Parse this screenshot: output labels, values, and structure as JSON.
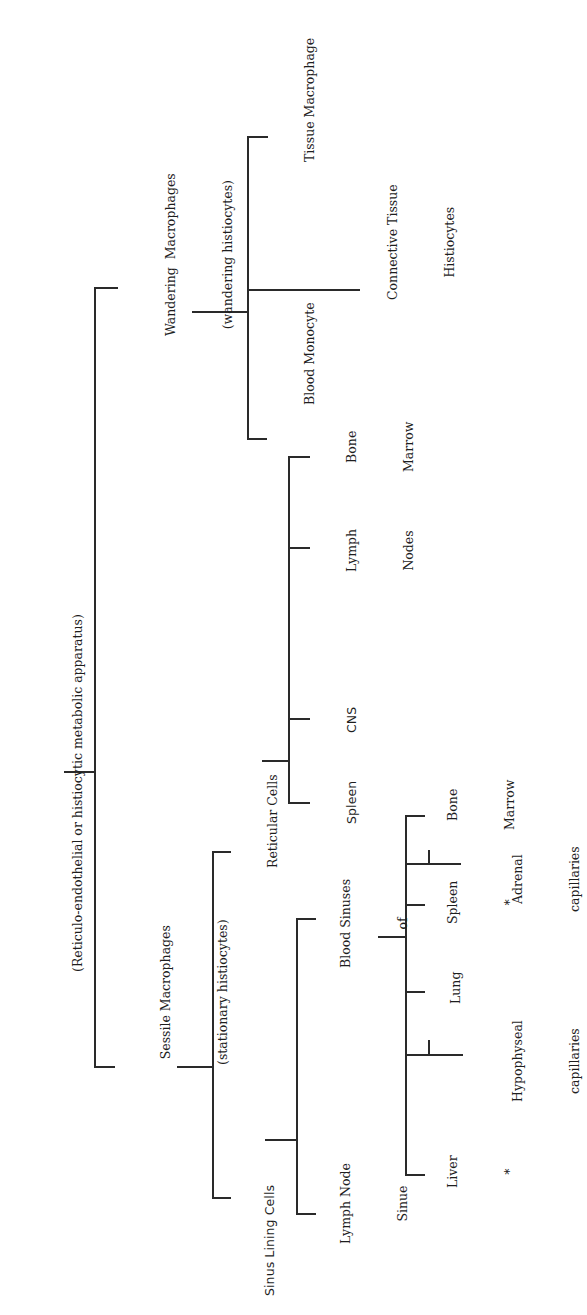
{
  "diagram": {
    "orientation": "rotated 90 degrees counter-clockwise",
    "root": {
      "label": "(Reticulo-endothelial or histiocytic metabolic apparatus)"
    },
    "wandering": {
      "line1": "Wandering  Macrophages",
      "line2": "(wandering histiocytes)",
      "children": {
        "blood_monocyte": "Blood Monocyte",
        "connective_line1": "Connective Tissue",
        "connective_line2": "Histiocytes",
        "tissue_macrophage": "Tissue Macrophage"
      }
    },
    "sessile": {
      "line1": "Sessile Macrophages",
      "line2": "(stationary histiocytes)",
      "reticular": {
        "label": "Reticular Cells",
        "children": {
          "spleen": "Spleen",
          "cns": "CNS",
          "lymph_line1": "Lymph",
          "lymph_line2": "Nodes",
          "bone_line1": "Bone",
          "bone_line2": "Marrow"
        }
      },
      "sinus": {
        "label": "Sinus Lining Cells",
        "lymph_node_line1": "Lymph Node",
        "lymph_node_line2": "Sinue",
        "blood_line1": "Blood Sinuses",
        "blood_line2": "of",
        "children": {
          "liver": "Liver",
          "liver_mark": "*",
          "lung": "Lung",
          "spleen": "Spleen",
          "spleen_mark": "*",
          "bone_line1": "Bone",
          "bone_line2": "Marrow",
          "hypophyseal_line1": "Hypophyseal",
          "hypophyseal_line2": "capillaries",
          "adrenal_line1": "Adrenal",
          "adrenal_line2": "capillaries"
        }
      }
    },
    "colors": {
      "line": "#2a2a2a",
      "text": "#1e1e1e",
      "background": "#ffffff"
    }
  }
}
